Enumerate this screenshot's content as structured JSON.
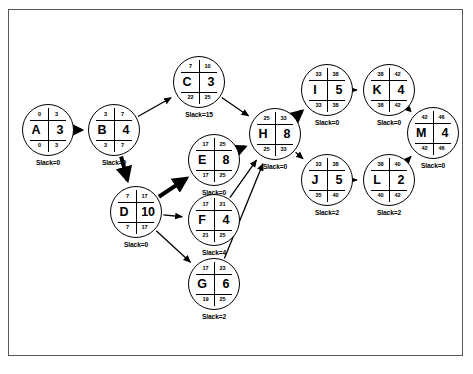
{
  "diagram": {
    "type": "cpm-activity-on-node-network",
    "slack_prefix": "Slack=",
    "nodes": [
      {
        "id": "A",
        "name": "A",
        "duration": "3",
        "es": "0",
        "ef": "3",
        "ls": "0",
        "lf": "3",
        "slack": "Slack=0",
        "x": 48,
        "y": 130
      },
      {
        "id": "B",
        "name": "B",
        "duration": "4",
        "es": "3",
        "ef": "7",
        "ls": "3",
        "lf": "7",
        "slack": "Slack=0",
        "x": 114,
        "y": 130
      },
      {
        "id": "C",
        "name": "C",
        "duration": "3",
        "es": "7",
        "ef": "10",
        "ls": "22",
        "lf": "25",
        "slack": "Slack=15",
        "x": 199,
        "y": 82
      },
      {
        "id": "D",
        "name": "D",
        "duration": "10",
        "es": "7",
        "ef": "17",
        "ls": "7",
        "lf": "17",
        "slack": "Slack=0",
        "x": 136,
        "y": 212
      },
      {
        "id": "E",
        "name": "E",
        "duration": "8",
        "es": "17",
        "ef": "25",
        "ls": "17",
        "lf": "25",
        "slack": "Slack=0",
        "x": 214,
        "y": 160
      },
      {
        "id": "F",
        "name": "F",
        "duration": "4",
        "es": "17",
        "ef": "21",
        "ls": "21",
        "lf": "25",
        "slack": "Slack=4",
        "x": 214,
        "y": 220
      },
      {
        "id": "G",
        "name": "G",
        "duration": "6",
        "es": "17",
        "ef": "23",
        "ls": "19",
        "lf": "25",
        "slack": "Slack=2",
        "x": 214,
        "y": 284
      },
      {
        "id": "H",
        "name": "H",
        "duration": "8",
        "es": "25",
        "ef": "33",
        "ls": "25",
        "lf": "33",
        "slack": "Slack=0",
        "x": 275,
        "y": 134
      },
      {
        "id": "I",
        "name": "I",
        "duration": "5",
        "es": "33",
        "ef": "38",
        "ls": "33",
        "lf": "38",
        "slack": "Slack=0",
        "x": 327,
        "y": 90
      },
      {
        "id": "K",
        "name": "K",
        "duration": "4",
        "es": "38",
        "ef": "42",
        "ls": "38",
        "lf": "42",
        "slack": "Slack=0",
        "x": 389,
        "y": 90
      },
      {
        "id": "M",
        "name": "M",
        "duration": "4",
        "es": "42",
        "ef": "46",
        "ls": "42",
        "lf": "46",
        "slack": "Slack=0",
        "x": 433,
        "y": 133
      },
      {
        "id": "J",
        "name": "J",
        "duration": "5",
        "es": "33",
        "ef": "38",
        "ls": "35",
        "lf": "40",
        "slack": "Slack=2",
        "x": 327,
        "y": 180
      },
      {
        "id": "L",
        "name": "L",
        "duration": "2",
        "es": "38",
        "ef": "40",
        "ls": "40",
        "lf": "42",
        "slack": "Slack=2",
        "x": 389,
        "y": 180
      }
    ],
    "edges": [
      {
        "from": "A",
        "to": "B",
        "critical": true
      },
      {
        "from": "B",
        "to": "C",
        "critical": false
      },
      {
        "from": "B",
        "to": "D",
        "critical": true
      },
      {
        "from": "C",
        "to": "H",
        "critical": false
      },
      {
        "from": "D",
        "to": "E",
        "critical": true
      },
      {
        "from": "D",
        "to": "F",
        "critical": false
      },
      {
        "from": "D",
        "to": "G",
        "critical": false
      },
      {
        "from": "E",
        "to": "H",
        "critical": true
      },
      {
        "from": "F",
        "to": "H",
        "critical": false
      },
      {
        "from": "G",
        "to": "H",
        "critical": false
      },
      {
        "from": "H",
        "to": "I",
        "critical": true
      },
      {
        "from": "H",
        "to": "J",
        "critical": false
      },
      {
        "from": "I",
        "to": "K",
        "critical": false
      },
      {
        "from": "K",
        "to": "M",
        "critical": true
      },
      {
        "from": "J",
        "to": "L",
        "critical": false
      },
      {
        "from": "L",
        "to": "M",
        "critical": false
      }
    ],
    "colors": {
      "stroke": "#000000",
      "frame": "#58585a",
      "background": "#ffffff"
    }
  }
}
